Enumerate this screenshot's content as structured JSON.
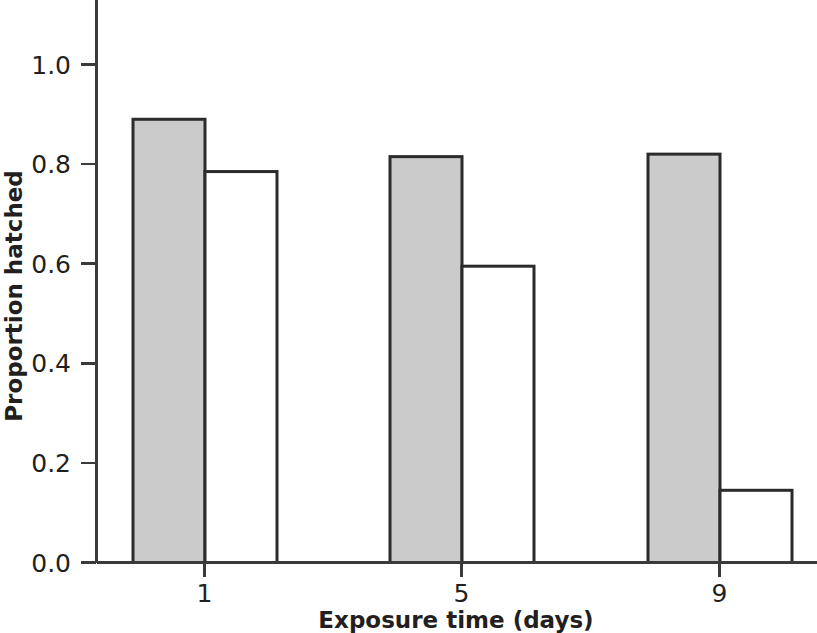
{
  "chart_data": {
    "type": "bar",
    "title": "",
    "subtitle": "",
    "xlabel": "Exposure time (days)",
    "ylabel": "Proportion hatched",
    "categories": [
      "1",
      "5",
      "9"
    ],
    "xtick_labels": [
      "1",
      "5",
      "9"
    ],
    "ytick_labels": [
      "0.0",
      "0.2",
      "0.4",
      "0.6",
      "0.8",
      "1.0"
    ],
    "ytick_values": [
      0.0,
      0.2,
      0.4,
      0.6,
      0.8,
      1.0
    ],
    "ylim": [
      0.0,
      1.08
    ],
    "xlim_note": "categorical, 3 groups of paired bars",
    "grid": false,
    "legend": "none",
    "series": [
      {
        "name": "filled",
        "style": "gray-filled-bar",
        "color": "#cbcbcb",
        "edge_color": "#2b2b2b",
        "values": [
          0.89,
          0.815,
          0.82
        ]
      },
      {
        "name": "open",
        "style": "white-open-bar",
        "color": "#ffffff",
        "edge_color": "#2b2b2b",
        "values": [
          0.785,
          0.595,
          0.145
        ]
      }
    ]
  },
  "figure": {
    "background": "#ffffff",
    "axis_color": "#3a3a3a",
    "text_color": "#231f20"
  }
}
